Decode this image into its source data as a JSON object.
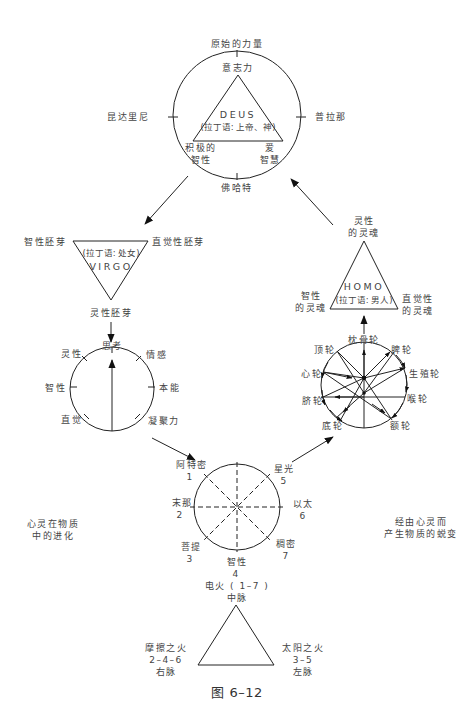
{
  "figure_caption": "图 6–12",
  "top_circle": {
    "top": "原始的力量",
    "left": "昆达里尼",
    "right": "普拉那",
    "bottom": "佛哈特",
    "triangle": {
      "apex": "意志力",
      "center_title": "DEUS",
      "center_sub": "(拉丁语: 上帝、神)",
      "bottom_left_1": "积极的",
      "bottom_left_2": "智性",
      "bottom_right_1": "爱",
      "bottom_right_2": "智慧"
    }
  },
  "virgo_triangle": {
    "left": "智性胚芽",
    "right": "直觉性胚芽",
    "bottom": "灵性胚芽",
    "center_sub": "(拉丁语: 处女)",
    "center_title": "VIRGO"
  },
  "thought_circle": {
    "top": "思考",
    "upper_left": "灵性",
    "upper_right": "情感",
    "left": "智性",
    "right": "本能",
    "lower_left": "直觉",
    "lower_right": "凝聚力"
  },
  "homo_triangle": {
    "apex_1": "灵性",
    "apex_2": "的灵魂",
    "left_1": "智性",
    "left_2": "的灵魂",
    "right_1": "直觉性",
    "right_2": "的灵魂",
    "center_title": "HOMO",
    "center_sub": "(拉丁语: 男人)"
  },
  "chakra_circle": {
    "top": "枕骨轮",
    "upper_left": "顶轮",
    "upper_right": "脾轮",
    "left_upper": "心轮",
    "right_upper": "生殖轮",
    "left_lower": "脐轮",
    "right_lower": "喉轮",
    "lower_left": "底轮",
    "lower_right": "额轮"
  },
  "rays_circle": {
    "r1_name": "阿特密",
    "r1_num": "1",
    "r2_name": "末那",
    "r2_num": "2",
    "r3_name": "菩提",
    "r3_num": "3",
    "r4_name": "智性",
    "r4_num": "4",
    "r5_name": "星光",
    "r5_num": "5",
    "r6_name": "以太",
    "r6_num": "6",
    "r7_name": "稠密",
    "r7_num": "7"
  },
  "side_notes": {
    "left_1": "心灵在物质",
    "left_2": "中的进化",
    "right_1": "经由心灵而",
    "right_2": "产生物质的蜕变"
  },
  "fire_triangle": {
    "apex_1": "电火 ( 1–7 )",
    "apex_2": "中脉",
    "left_1": "摩擦之火",
    "left_2": "2–4–6",
    "left_3": "右脉",
    "right_1": "太阳之火",
    "right_2": "3–5",
    "right_3": "左脉"
  }
}
